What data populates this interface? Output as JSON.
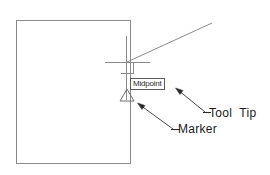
{
  "diagram": {
    "colors": {
      "geometry_line": "#8a8a8a",
      "crosshair": "#8a8a8a",
      "marker": "#6e6e6e",
      "tooltip_border": "#5a5a5a",
      "tooltip_background": "#ffffff",
      "tooltip_text": "#2b2b2b",
      "annotation_text": "#1a1a1a",
      "leader_line": "#4a4a4a",
      "background": "#ffffff"
    },
    "shapes": {
      "rectangle": {
        "name": "drawing-rectangle",
        "x": 16,
        "y": 20,
        "width": 114,
        "height": 143
      },
      "crosshair": {
        "name": "crosshair-cursor",
        "center_x": 127,
        "center_y": 62,
        "horizontal_from_x": 105,
        "horizontal_to_x": 150,
        "vertical_from_y": 36,
        "vertical_to_y": 100,
        "pickbox_x": 127,
        "pickbox_y": 62,
        "pickbox_size": 11
      },
      "diagonal_line": {
        "name": "diagonal-object-line",
        "x1": 127,
        "y1": 62,
        "x2": 212,
        "y2": 23
      },
      "marker_triangle": {
        "name": "midpoint-marker-triangle",
        "center_x": 127,
        "center_y": 96,
        "half_width": 7,
        "height": 12
      }
    },
    "tooltip": {
      "name": "midpoint-tooltip",
      "text": "Midpoint",
      "x": 130,
      "y": 78,
      "width": 37,
      "height": 12
    },
    "annotations": [
      {
        "id": "tooltip-callout",
        "label": "Tool  Tip",
        "label_x": 209,
        "label_y": 106,
        "leader": {
          "x1": 205,
          "y1": 113,
          "x2": 176,
          "y2": 89
        },
        "arrow_at": "start-of-leader-tip",
        "arrow_x": 176,
        "arrow_y": 89
      },
      {
        "id": "marker-callout",
        "label": "Marker",
        "label_x": 178,
        "label_y": 122,
        "leader": {
          "x1": 173,
          "y1": 130,
          "x2": 138,
          "y2": 104
        },
        "arrow_at": "start-of-leader-tip",
        "arrow_x": 138,
        "arrow_y": 104
      }
    ]
  }
}
